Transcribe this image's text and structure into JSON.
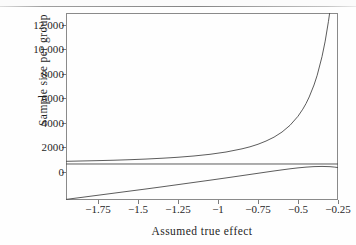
{
  "figure": {
    "background_color": "#fefefe",
    "ink_color": "#4a4a4a",
    "axis_color": "#8a8a8a"
  },
  "axis_titles": {
    "x": "Assumed true effect",
    "y": "Sample size per group"
  },
  "y_ticks": [
    {
      "value": 0,
      "label": "0"
    },
    {
      "value": 2000,
      "label": "2000"
    },
    {
      "value": 4000,
      "label": "4000"
    },
    {
      "value": 6000,
      "label": "6000"
    },
    {
      "value": 8000,
      "label": "8000"
    },
    {
      "value": 10000,
      "label": "10,000"
    },
    {
      "value": 12000,
      "label": "12,000"
    }
  ],
  "x_ticks": [
    {
      "value": -1.75,
      "label": "−1.75"
    },
    {
      "value": -1.5,
      "label": "−1.5"
    },
    {
      "value": -1.25,
      "label": "−1.25"
    },
    {
      "value": -1,
      "label": "−1"
    },
    {
      "value": -0.75,
      "label": "−0.75"
    },
    {
      "value": -0.5,
      "label": "−0.5"
    },
    {
      "value": -0.25,
      "label": "−0.25"
    }
  ],
  "chart_data": {
    "type": "line",
    "title": "",
    "subtitle": "",
    "xlabel": "Assumed true effect",
    "ylabel": "Sample size per group",
    "xlim": [
      -1.9,
      -0.2
    ],
    "ylim": [
      -3100,
      13000
    ],
    "grid": false,
    "legend": "none",
    "annotations": [],
    "series": [
      {
        "name": "required-sample-size",
        "color": "#4a4a4a",
        "x": [
          -1.9,
          -1.85,
          -1.8,
          -1.75,
          -1.7,
          -1.6,
          -1.5,
          -1.4,
          -1.3,
          -1.25,
          -1.2,
          -1.1,
          -1.0,
          -0.9,
          -0.8,
          -0.75,
          -0.7,
          -0.65,
          -0.6,
          -0.55,
          -0.5,
          -0.45,
          -0.42,
          -0.4,
          -0.38,
          -0.35,
          -0.33,
          -0.3,
          -0.28,
          -0.26,
          -0.25,
          -0.24
        ],
        "y": [
          230,
          245,
          260,
          275,
          290,
          325,
          370,
          425,
          495,
          535,
          580,
          690,
          835,
          1030,
          1305,
          1480,
          1700,
          1975,
          2310,
          2750,
          3330,
          4110,
          4720,
          5200,
          5770,
          6800,
          7640,
          9240,
          10580,
          12250,
          13200,
          14400
        ]
      },
      {
        "name": "zero-reference-line",
        "color": "#4a4a4a",
        "x": [
          -1.9,
          -0.2
        ],
        "y": [
          0,
          0
        ]
      },
      {
        "name": "lower-bound-curve",
        "color": "#4a4a4a",
        "x": [
          -1.9,
          -1.85,
          -1.8,
          -1.75,
          -1.7,
          -1.6,
          -1.5,
          -1.4,
          -1.3,
          -1.25,
          -1.2,
          -1.1,
          -1.0,
          -0.9,
          -0.8,
          -0.75,
          -0.7,
          -0.65,
          -0.6,
          -0.55,
          -0.5,
          -0.45,
          -0.4,
          -0.35,
          -0.3,
          -0.25,
          -0.22,
          -0.2
        ],
        "y": [
          -3050,
          -2960,
          -2870,
          -2780,
          -2690,
          -2510,
          -2330,
          -2150,
          -1965,
          -1870,
          -1775,
          -1585,
          -1395,
          -1200,
          -1000,
          -900,
          -800,
          -700,
          -600,
          -505,
          -415,
          -335,
          -270,
          -225,
          -210,
          -230,
          -270,
          -310
        ]
      }
    ]
  }
}
